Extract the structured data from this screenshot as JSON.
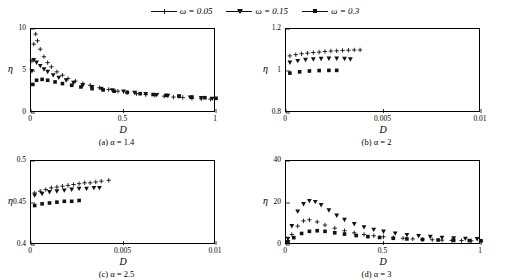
{
  "legend": {
    "entries": [
      {
        "label": "ω = 0.05",
        "marker": "plus",
        "color": "#111111"
      },
      {
        "label": "ω = 0.15",
        "marker": "triangle",
        "color": "#111111"
      },
      {
        "label": "ω = 0.3",
        "marker": "square",
        "color": "#111111"
      }
    ]
  },
  "chart_data": [
    {
      "type": "scatter",
      "title": "(a) α = 1.4",
      "caption_prefix": "(a)",
      "xlabel": "D",
      "ylabel": "η",
      "xlim": [
        0,
        1
      ],
      "ylim": [
        0,
        10
      ],
      "xticks": [
        0,
        0.5,
        1
      ],
      "xticklabels": [
        "0",
        "0.5",
        "1"
      ],
      "yticks": [
        0,
        5,
        10
      ],
      "yticklabels": [
        "0",
        "5",
        "10"
      ],
      "grid": false,
      "series": [
        {
          "name": "ω = 0.05",
          "marker": "plus",
          "x": [
            0.005,
            0.015,
            0.025,
            0.035,
            0.05,
            0.07,
            0.09,
            0.11,
            0.14,
            0.17,
            0.2,
            0.24,
            0.28,
            0.32,
            0.37,
            0.42,
            0.47,
            0.52,
            0.57,
            0.62,
            0.67,
            0.72,
            0.77,
            0.82,
            0.87,
            0.92,
            0.97
          ],
          "y": [
            6.2,
            8.2,
            9.4,
            8.6,
            7.6,
            6.7,
            6.0,
            5.5,
            4.9,
            4.5,
            4.1,
            3.8,
            3.5,
            3.3,
            3.0,
            2.8,
            2.6,
            2.45,
            2.3,
            2.2,
            2.1,
            2.0,
            1.9,
            1.85,
            1.75,
            1.7,
            1.65
          ]
        },
        {
          "name": "ω = 0.15",
          "marker": "triangle",
          "x": [
            0.005,
            0.015,
            0.03,
            0.05,
            0.07,
            0.09,
            0.12,
            0.15,
            0.19,
            0.23,
            0.28,
            0.33,
            0.38,
            0.44,
            0.5,
            0.56,
            0.62,
            0.68,
            0.74,
            0.8,
            0.86,
            0.92,
            0.98
          ],
          "y": [
            5.0,
            6.3,
            6.0,
            5.6,
            5.2,
            4.9,
            4.5,
            4.2,
            3.9,
            3.6,
            3.3,
            3.1,
            2.9,
            2.7,
            2.55,
            2.4,
            2.25,
            2.15,
            2.05,
            1.95,
            1.85,
            1.78,
            1.7
          ]
        },
        {
          "name": "ω = 0.3",
          "marker": "square",
          "x": [
            0.01,
            0.03,
            0.06,
            0.09,
            0.13,
            0.17,
            0.22,
            0.27,
            0.33,
            0.39,
            0.45,
            0.52,
            0.59,
            0.66,
            0.73,
            0.8,
            0.87,
            0.94,
            1.0
          ],
          "y": [
            3.4,
            3.9,
            4.0,
            3.9,
            3.7,
            3.5,
            3.3,
            3.1,
            2.9,
            2.75,
            2.6,
            2.45,
            2.3,
            2.2,
            2.1,
            2.0,
            1.9,
            1.82,
            1.75
          ]
        }
      ]
    },
    {
      "type": "scatter",
      "title": "(b) α = 2",
      "caption_prefix": "(b)",
      "xlabel": "D",
      "ylabel": "η",
      "xlim": [
        0,
        0.01
      ],
      "ylim": [
        0.8,
        1.2
      ],
      "xticks": [
        0,
        0.005,
        0.01
      ],
      "xticklabels": [
        "0",
        "0.005",
        "0.01"
      ],
      "yticks": [
        0.8,
        1.0,
        1.2
      ],
      "yticklabels": [
        "0.8",
        "1",
        "1.2"
      ],
      "grid": false,
      "series": [
        {
          "name": "ω = 0.05",
          "marker": "plus",
          "x": [
            0.0002,
            0.0005,
            0.0008,
            0.0011,
            0.0014,
            0.0017,
            0.002,
            0.0023,
            0.0026,
            0.0029,
            0.0032,
            0.0035,
            0.0038
          ],
          "y": [
            1.072,
            1.078,
            1.082,
            1.085,
            1.088,
            1.09,
            1.093,
            1.095,
            1.096,
            1.098,
            1.099,
            1.1,
            1.1
          ]
        },
        {
          "name": "ω = 0.15",
          "marker": "triangle",
          "x": [
            0.0002,
            0.0006,
            0.001,
            0.0014,
            0.0018,
            0.0022,
            0.0026,
            0.003,
            0.0033
          ],
          "y": [
            1.04,
            1.048,
            1.053,
            1.056,
            1.058,
            1.059,
            1.059,
            1.058,
            1.056
          ]
        },
        {
          "name": "ω = 0.3",
          "marker": "square",
          "x": [
            0.0002,
            0.0007,
            0.0012,
            0.0017,
            0.0022,
            0.0026
          ],
          "y": [
            0.99,
            0.996,
            1.0,
            1.002,
            1.003,
            1.003
          ]
        }
      ]
    },
    {
      "type": "scatter",
      "title": "(c) α = 2.5",
      "caption_prefix": "(c)",
      "xlabel": "D",
      "ylabel": "η",
      "xlim": [
        0,
        0.01
      ],
      "ylim": [
        0.4,
        0.5
      ],
      "xticks": [
        0,
        0.005,
        0.01
      ],
      "xticklabels": [
        "0",
        "0.005",
        "0.01"
      ],
      "yticks": [
        0.4,
        0.45,
        0.5
      ],
      "yticklabels": [
        "0.4",
        "0.45",
        "0.5"
      ],
      "grid": false,
      "series": [
        {
          "name": "ω = 0.05",
          "marker": "plus",
          "x": [
            0.0002,
            0.0005,
            0.0008,
            0.0011,
            0.0014,
            0.0017,
            0.002,
            0.0023,
            0.0026,
            0.0029,
            0.0032,
            0.0035,
            0.0038,
            0.0042
          ],
          "y": [
            0.462,
            0.464,
            0.466,
            0.468,
            0.469,
            0.47,
            0.471,
            0.472,
            0.473,
            0.474,
            0.474,
            0.475,
            0.476,
            0.477
          ]
        },
        {
          "name": "ω = 0.15",
          "marker": "triangle",
          "x": [
            0.0002,
            0.0006,
            0.001,
            0.0014,
            0.0018,
            0.0022,
            0.0026,
            0.003,
            0.0034,
            0.0037
          ],
          "y": [
            0.459,
            0.461,
            0.463,
            0.464,
            0.465,
            0.466,
            0.467,
            0.467,
            0.468,
            0.468
          ]
        },
        {
          "name": "ω = 0.3",
          "marker": "square",
          "x": [
            0.0002,
            0.0006,
            0.001,
            0.0014,
            0.0018,
            0.0022,
            0.0026
          ],
          "y": [
            0.447,
            0.449,
            0.45,
            0.451,
            0.452,
            0.452,
            0.453
          ]
        }
      ]
    },
    {
      "type": "scatter",
      "title": "(d) α = 3",
      "caption_prefix": "(d)",
      "xlabel": "D",
      "ylabel": "η",
      "xlim": [
        0,
        1
      ],
      "ylim": [
        0,
        40
      ],
      "xticks": [
        0,
        0.5,
        1
      ],
      "xticklabels": [
        "0",
        "0.5",
        "1"
      ],
      "yticks": [
        0,
        20,
        40
      ],
      "yticklabels": [
        "0",
        "20",
        "40"
      ],
      "grid": false,
      "series": [
        {
          "name": "ω = 0.05",
          "marker": "plus",
          "x": [
            0.01,
            0.03,
            0.06,
            0.09,
            0.12,
            0.16,
            0.2,
            0.25,
            0.3,
            0.35,
            0.4,
            0.45,
            0.5,
            0.55,
            0.6,
            0.65,
            0.7,
            0.75,
            0.8,
            0.85,
            0.9,
            0.95,
            1.0
          ],
          "y": [
            2.0,
            5.0,
            9.0,
            11.5,
            12.0,
            11.0,
            9.5,
            8.0,
            6.8,
            5.8,
            5.0,
            4.4,
            3.9,
            3.5,
            3.2,
            2.9,
            2.7,
            2.5,
            2.3,
            2.2,
            2.1,
            2.0,
            1.9
          ]
        },
        {
          "name": "ω = 0.15",
          "marker": "triangle",
          "x": [
            0.01,
            0.03,
            0.06,
            0.09,
            0.12,
            0.15,
            0.18,
            0.22,
            0.26,
            0.3,
            0.35,
            0.4,
            0.45,
            0.5,
            0.56,
            0.62,
            0.68,
            0.74,
            0.8,
            0.86,
            0.92,
            0.98
          ],
          "y": [
            3.0,
            9.0,
            16.0,
            19.5,
            21.0,
            20.5,
            19.0,
            16.5,
            14.0,
            12.0,
            10.0,
            8.5,
            7.3,
            6.4,
            5.5,
            4.8,
            4.3,
            3.9,
            3.5,
            3.2,
            3.0,
            2.8
          ]
        },
        {
          "name": "ω = 0.3",
          "marker": "square",
          "x": [
            0.01,
            0.04,
            0.08,
            0.12,
            0.16,
            0.2,
            0.25,
            0.3,
            0.36,
            0.42,
            0.48,
            0.55,
            0.62,
            0.7,
            0.78,
            0.86,
            0.94,
            1.0
          ],
          "y": [
            1.5,
            3.5,
            5.5,
            6.5,
            6.8,
            6.5,
            5.8,
            5.2,
            4.5,
            4.0,
            3.6,
            3.2,
            2.9,
            2.6,
            2.4,
            2.2,
            2.1,
            2.0
          ]
        }
      ]
    }
  ]
}
